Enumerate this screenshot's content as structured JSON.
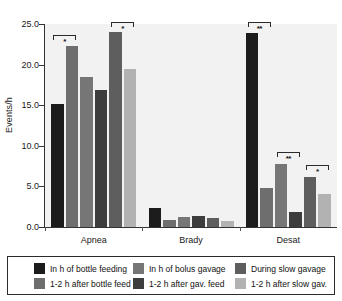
{
  "chart_data": {
    "type": "bar",
    "title": "",
    "xlabel": "",
    "ylabel": "Events/h",
    "categories": [
      "Apnea",
      "Brady",
      "Desat"
    ],
    "ylim": [
      0.0,
      25.0
    ],
    "yticks": [
      "0.0",
      "5.0",
      "10.0",
      "15.0",
      "20.0",
      "25.0"
    ],
    "ytick_values": [
      0.0,
      5.0,
      10.0,
      15.0,
      20.0,
      25.0
    ],
    "grid": false,
    "legend_position": "bottom",
    "series": [
      {
        "name": "In h of bottle feeding",
        "color": "#1c1c1c",
        "values": [
          15.1,
          2.3,
          23.9
        ]
      },
      {
        "name": "1-2 h after bottle feed",
        "color": "#6e6e6e",
        "values": [
          22.3,
          0.9,
          4.8
        ]
      },
      {
        "name": "In h of bolus gavage",
        "color": "#767676",
        "values": [
          18.5,
          1.2,
          7.7
        ]
      },
      {
        "name": "1-2 h after gav. feed",
        "color": "#3d3d3d",
        "values": [
          16.9,
          1.3,
          1.9
        ]
      },
      {
        "name": "During slow gavage",
        "color": "#5e5e5e",
        "values": [
          24.0,
          1.1,
          6.1
        ]
      },
      {
        "name": "1-2 h after slow gav.",
        "color": "#b2b2b2",
        "values": [
          19.5,
          0.7,
          4.1
        ]
      }
    ],
    "annotations": [
      {
        "group": "Apnea",
        "from_series": 0,
        "to_series": 1,
        "label": "*",
        "top_value": 23.6
      },
      {
        "group": "Apnea",
        "from_series": 4,
        "to_series": 5,
        "label": "*",
        "top_value": 25.3
      },
      {
        "group": "Desat",
        "from_series": 0,
        "to_series": 1,
        "label": "**",
        "top_value": 25.3
      },
      {
        "group": "Desat",
        "from_series": 2,
        "to_series": 3,
        "label": "**",
        "top_value": 9.2
      },
      {
        "group": "Desat",
        "from_series": 4,
        "to_series": 5,
        "label": "*",
        "top_value": 7.6
      }
    ]
  },
  "legend": {
    "columns": [
      {
        "entries": [
          {
            "label": "In h of bottle feeding",
            "color": "#1c1c1c"
          },
          {
            "label": "1-2 h after bottle feed",
            "color": "#6e6e6e"
          }
        ]
      },
      {
        "entries": [
          {
            "label": "In h of bolus gavage",
            "color": "#767676"
          },
          {
            "label": "1-2 h after gav. feed",
            "color": "#3d3d3d"
          }
        ]
      },
      {
        "entries": [
          {
            "label": "During slow gavage",
            "color": "#5e5e5e"
          },
          {
            "label": "1-2 h after slow gav.",
            "color": "#b2b2b2"
          }
        ]
      }
    ]
  },
  "style": {
    "panel_background": "#f2f2f2",
    "axis_color": "#333333",
    "text_color": "#1a1a1a"
  }
}
